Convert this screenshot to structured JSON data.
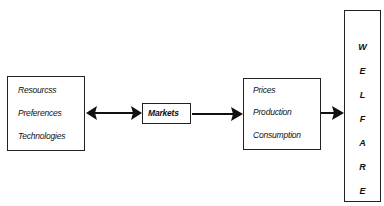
{
  "diagram": {
    "inputs_box": {
      "items": [
        "Resourcss",
        "Preferences",
        "Technologies"
      ]
    },
    "markets_box": {
      "label": "Markets"
    },
    "outcomes_box": {
      "items": [
        "Prices",
        "Production",
        "Consumption"
      ]
    },
    "welfare_box": {
      "letters": [
        "W",
        "E",
        "L",
        "F",
        "A",
        "R",
        "E"
      ]
    },
    "connections": [
      {
        "from": "inputs_box",
        "to": "markets_box",
        "type": "bidirectional"
      },
      {
        "from": "markets_box",
        "to": "outcomes_box",
        "type": "directed"
      },
      {
        "from": "outcomes_box",
        "to": "welfare_box",
        "type": "directed"
      }
    ]
  }
}
